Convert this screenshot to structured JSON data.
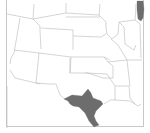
{
  "map": {
    "title": "Range map",
    "frame_color": "#c8c8c8",
    "border_color": "#b9b9b9",
    "range_color": "#6d6d6d",
    "regions": [
      {
        "name": "South Texas range",
        "shaded": true
      },
      {
        "name": "Lake Michigan",
        "shaded": true
      }
    ]
  }
}
